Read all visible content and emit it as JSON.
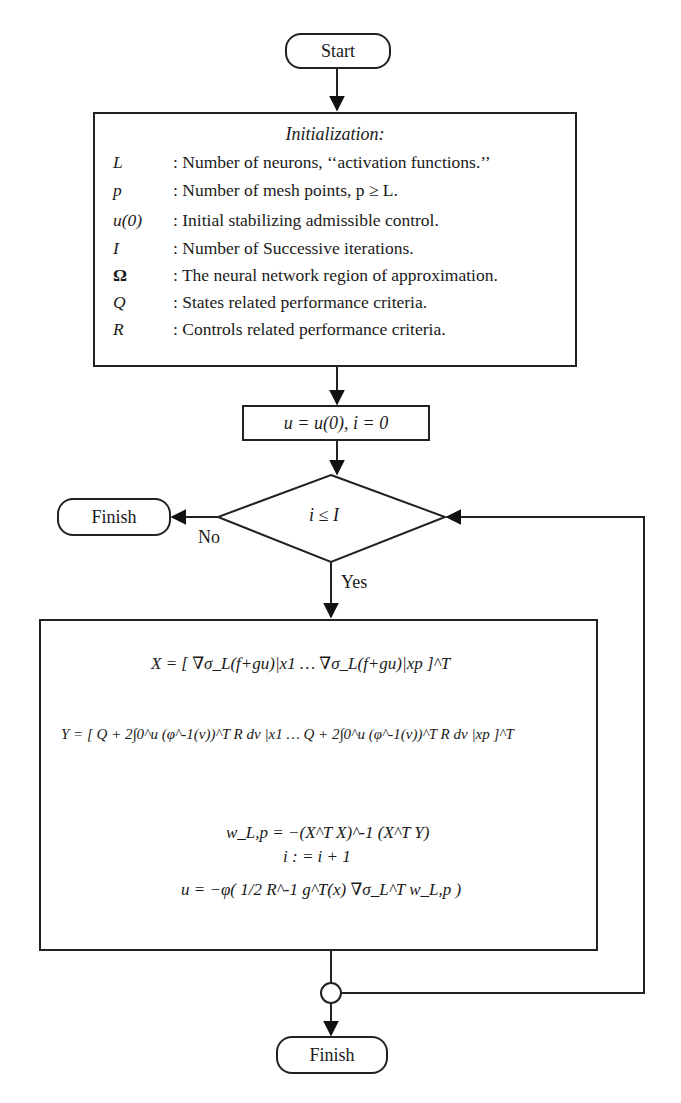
{
  "start": {
    "label": "Start"
  },
  "initialization": {
    "title": "Initialization:",
    "definitions": [
      {
        "symbol": "L",
        "text": ": Number of neurons, ‘‘activation functions.’’"
      },
      {
        "symbol": "p",
        "text": ": Number of mesh points, p ≥ L."
      },
      {
        "symbol": "u(0)",
        "text": ": Initial stabilizing admissible control."
      },
      {
        "symbol": "I",
        "text": ": Number of Successive iterations."
      },
      {
        "symbol": "Ω",
        "text": ": The neural network region of approximation."
      },
      {
        "symbol": "Q",
        "text": ": States related performance criteria."
      },
      {
        "symbol": "R",
        "text": ": Controls related performance criteria."
      }
    ]
  },
  "set_step": {
    "text": "u = u(0),   i = 0"
  },
  "decision": {
    "condition": "i ≤ I",
    "no_label": "No",
    "yes_label": "Yes"
  },
  "finish_left": {
    "label": "Finish"
  },
  "process": {
    "X_eq": "X = [ ∇σ_L(f+gu)|x1 … ∇σ_L(f+gu)|xp ]^T",
    "Y_eq": "Y = [ Q + 2∫0^u (φ^-1(v))^T R dv |x1 … Q + 2∫0^u (φ^-1(v))^T R dv |xp ]^T",
    "w_eq": "w_L,p = −(X^T X)^-1 (X^T Y)",
    "i_eq": "i : = i + 1",
    "u_eq": "u = −φ( 1/2 R^-1 g^T(x) ∇σ_L^T w_L,p )"
  },
  "finish_bottom": {
    "label": "Finish"
  }
}
